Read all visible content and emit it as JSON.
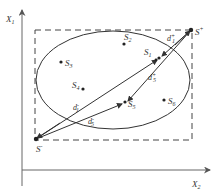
{
  "diagram": {
    "type": "geometric-distance-diagram",
    "axes": {
      "vertical_label": "X",
      "vertical_sub": "1",
      "horizontal_label": "X",
      "horizontal_sub": "2"
    },
    "ideal_points": {
      "positive": {
        "label": "S",
        "sup": "+"
      },
      "negative": {
        "label": "S",
        "sup": "-"
      }
    },
    "points": [
      {
        "id": "S1",
        "label": "S",
        "sub": "1"
      },
      {
        "id": "S2",
        "label": "S",
        "sub": "2"
      },
      {
        "id": "S3",
        "label": "S",
        "sub": "3"
      },
      {
        "id": "S4",
        "label": "S",
        "sub": "4"
      },
      {
        "id": "S5",
        "label": "S",
        "sub": "5"
      },
      {
        "id": "S6",
        "label": "S",
        "sub": "6"
      }
    ],
    "distances": [
      {
        "id": "d1_plus",
        "label": "d",
        "sub": "1",
        "sup": "+"
      },
      {
        "id": "d5_plus",
        "label": "d",
        "sub": "5",
        "sup": "+"
      },
      {
        "id": "d1_minus",
        "label": "d",
        "sub": "1",
        "sup": "-"
      },
      {
        "id": "d5_minus",
        "label": "d",
        "sub": "5",
        "sup": "-"
      }
    ],
    "colors": {
      "line": "#333333",
      "axis": "#555555",
      "background": "#ffffff"
    }
  }
}
